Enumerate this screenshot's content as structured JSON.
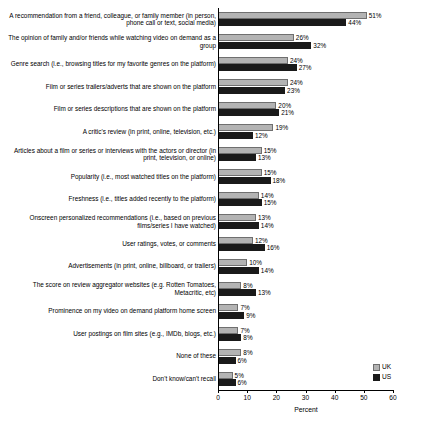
{
  "chart_data": {
    "type": "bar",
    "orientation": "horizontal",
    "title": "",
    "xlabel": "Percent",
    "ylabel": "",
    "xlim": [
      0,
      60
    ],
    "xticks": [
      0,
      10,
      20,
      30,
      40,
      50,
      60
    ],
    "grid": false,
    "legend_position": "bottom-right",
    "categories": [
      "A recommendation from a friend, colleague, or family member (in person, phone call or text, social media)",
      "The opinion of family and/or friends while watching video on demand as a group",
      "Genre search (i.e., browsing titles for my favorite genres on the platform)",
      "Film or series trailers/adverts that are shown on the platform",
      "Film or series descriptions that are shown on the platform",
      "A critic's review (in print, online, television, etc.)",
      "Articles about a film or series or interviews with the actors or director (in print, television, or online)",
      "Popularity (i.e., most watched titles on the platform)",
      "Freshness (i.e., titles added recently to the platform)",
      "Onscreen personalized recommendations (i.e., based on previous films/series I have watched)",
      "User ratings, votes, or comments",
      "Advertisements (in print, online, billboard, or trailers)",
      "The score on review aggregator websites (e.g. Rotten Tomatoes, Metacritic, etc)",
      "Prominence on my video on demand platform home screen",
      "User postings on film sites (e.g., IMDb, blogs, etc.)",
      "None of these",
      "Don't know/can't recall"
    ],
    "series": [
      {
        "name": "UK",
        "color": "#b3b3b3",
        "values": [
          51,
          26,
          24,
          24,
          20,
          19,
          15,
          15,
          14,
          13,
          12,
          10,
          8,
          7,
          7,
          8,
          5
        ]
      },
      {
        "name": "US",
        "color": "#1a1a1a",
        "values": [
          44,
          32,
          27,
          23,
          21,
          12,
          13,
          18,
          15,
          14,
          16,
          14,
          13,
          9,
          8,
          6,
          6
        ]
      }
    ]
  },
  "legend": {
    "items": [
      {
        "label": "UK",
        "key": "uk"
      },
      {
        "label": "US",
        "key": "us"
      }
    ]
  },
  "axis": {
    "x_title": "Percent",
    "tick_labels": [
      "0",
      "10",
      "20",
      "30",
      "40",
      "50",
      "60"
    ]
  }
}
